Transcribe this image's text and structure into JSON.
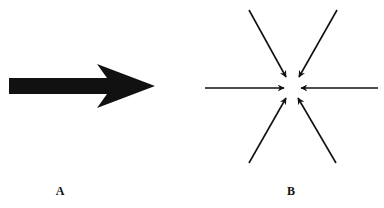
{
  "panels": [
    {
      "id": "A",
      "label": "A",
      "description": "single thick arrow pointing right"
    },
    {
      "id": "B",
      "label": "B",
      "description": "six thin arrows converging on a central point"
    }
  ],
  "colors": {
    "ink": "#111111",
    "background": "#ffffff"
  }
}
